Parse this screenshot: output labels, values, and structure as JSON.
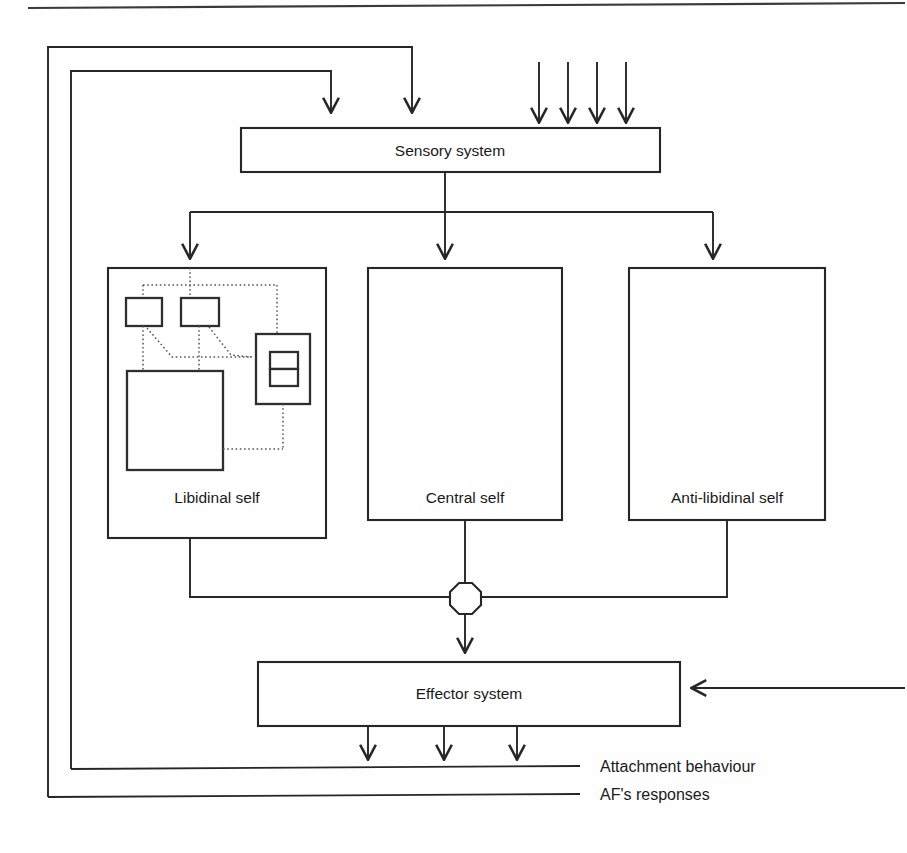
{
  "figure": {
    "type": "block-diagram",
    "domain": "attachment-theory-psychodynamic-model",
    "background": "#ffffff",
    "line_color": "#262626",
    "dotted_color": "#555555"
  },
  "blocks": {
    "sensory": {
      "label": "Sensory system"
    },
    "libidinal": {
      "label": "Libidinal self"
    },
    "central": {
      "label": "Central self"
    },
    "antilibidinal": {
      "label": "Anti-libidinal self"
    },
    "effector": {
      "label": "Effector system"
    }
  },
  "outputs": {
    "attachment": "Attachment behaviour",
    "af_responses": "AF's responses"
  },
  "inner_nodes": {
    "node_a": "",
    "node_b": "",
    "node_big": "",
    "node_frame": "",
    "node_split_top": "",
    "node_split_bottom": ""
  },
  "junction": {
    "shape": "octagon"
  },
  "counts": {
    "sensory_external_inputs": 4,
    "sensory_feedback_inputs": 2,
    "self_branches": 3,
    "effector_outputs": 3
  }
}
